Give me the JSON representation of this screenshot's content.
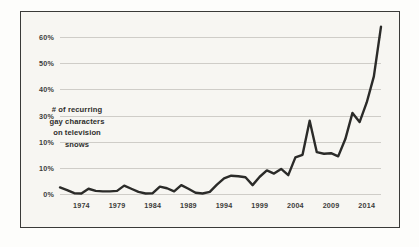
{
  "chart_data": {
    "type": "line",
    "title": "",
    "subtitle": "",
    "xlabel": "",
    "ylabel": "",
    "annotation": {
      "lines": [
        "# of recurring",
        "gay characters",
        "on television",
        "shows"
      ]
    },
    "xlim": [
      1971,
      2016
    ],
    "ylim": [
      0,
      65
    ],
    "ytick_labels": [
      "60%",
      "50%",
      "40%",
      "30%",
      "10%",
      "10%",
      "0%"
    ],
    "ytick_values": [
      60,
      50,
      40,
      30,
      20,
      10,
      0
    ],
    "xtick_labels": [
      "1974",
      "1979",
      "1984",
      "1989",
      "1994",
      "1999",
      "2004",
      "2009",
      "2014"
    ],
    "xtick_values": [
      1974,
      1979,
      1984,
      1989,
      1994,
      1999,
      2004,
      2009,
      2014
    ],
    "grid": true,
    "legend": "none",
    "line_color": "#2b2b29",
    "grid_color": "#cfcdc8",
    "background_color": "#f7f6f2",
    "border_color": "#3a3a38",
    "series": [
      {
        "name": "# of recurring gay characters on television shows",
        "x": [
          1971,
          1972,
          1973,
          1974,
          1975,
          1976,
          1977,
          1978,
          1979,
          1980,
          1981,
          1982,
          1983,
          1984,
          1985,
          1986,
          1987,
          1988,
          1989,
          1990,
          1991,
          1992,
          1993,
          1994,
          1995,
          1996,
          1997,
          1998,
          1999,
          2000,
          2001,
          2002,
          2003,
          2004,
          2005,
          2006,
          2007,
          2008,
          2009,
          2010,
          2011,
          2012,
          2013,
          2014,
          2015,
          2016
        ],
        "values": [
          2.5,
          1.5,
          0.3,
          0.2,
          2.0,
          1.2,
          1.0,
          1.0,
          1.2,
          3.2,
          2.0,
          0.8,
          0.2,
          0.3,
          2.8,
          2.2,
          1.0,
          3.4,
          2.0,
          0.5,
          0.2,
          0.8,
          3.6,
          6.0,
          7.0,
          6.8,
          6.4,
          3.4,
          6.6,
          9.0,
          7.8,
          9.6,
          7.2,
          14.0,
          15.0,
          28.0,
          16.0,
          15.4,
          15.6,
          14.4,
          21.0,
          31.0,
          27.5,
          35.0,
          45.0,
          64.0
        ]
      }
    ]
  }
}
